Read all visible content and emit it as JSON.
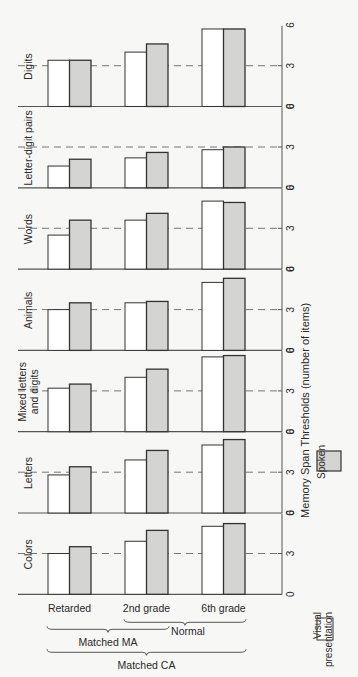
{
  "chart_data": {
    "type": "bar",
    "orientation_note": "small multiples; each panel is one stimulus type",
    "ylabel": "Memory Span Thresholds (number of items)",
    "ylim": [
      0,
      6
    ],
    "yticks": [
      "0",
      "3",
      "6"
    ],
    "reference_line": 3,
    "categories": [
      "Retarded",
      "2nd grade",
      "6th grade"
    ],
    "legend": [
      {
        "name": "Visual presentation",
        "line1": "Visual",
        "line2": "presentation",
        "fill": "#ffffff"
      },
      {
        "name": "Spoken",
        "line1": "Spoken",
        "line2": "",
        "fill": "#d4d4d2"
      }
    ],
    "panels": [
      {
        "label": "Digits",
        "line1": "Digits",
        "line2": "",
        "visual": [
          3.4,
          4.0,
          5.7
        ],
        "spoken": [
          3.4,
          4.6,
          5.7
        ]
      },
      {
        "label": "Letter-digit pairs",
        "line1": "Letter-digit pairs",
        "line2": "",
        "visual": [
          1.6,
          2.2,
          2.8
        ],
        "spoken": [
          2.1,
          2.6,
          3.0
        ]
      },
      {
        "label": "Words",
        "line1": "Words",
        "line2": "",
        "visual": [
          2.5,
          3.6,
          5.0
        ],
        "spoken": [
          3.6,
          4.1,
          4.9
        ]
      },
      {
        "label": "Animals",
        "line1": "Animals",
        "line2": "",
        "visual": [
          3.0,
          3.5,
          5.0
        ],
        "spoken": [
          3.5,
          3.6,
          5.3
        ]
      },
      {
        "label": "Mixed letters and digits",
        "line1": "Mixed letters",
        "line2": "and digits",
        "visual": [
          3.2,
          4.0,
          5.5
        ],
        "spoken": [
          3.5,
          4.6,
          5.6
        ]
      },
      {
        "label": "Letters",
        "line1": "Letters",
        "line2": "",
        "visual": [
          2.8,
          3.9,
          5.0
        ],
        "spoken": [
          3.4,
          4.6,
          5.4
        ]
      },
      {
        "label": "Colors",
        "line1": "Colors",
        "line2": "",
        "visual": [
          3.0,
          3.9,
          5.0
        ],
        "spoken": [
          3.5,
          4.7,
          5.2
        ]
      }
    ],
    "groupings": [
      {
        "label": "Normal",
        "spans": [
          "2nd grade",
          "6th grade"
        ]
      },
      {
        "label": "Matched MA",
        "spans": [
          "Retarded",
          "2nd grade"
        ]
      },
      {
        "label": "Matched CA",
        "spans": [
          "Retarded",
          "6th grade"
        ]
      }
    ]
  }
}
